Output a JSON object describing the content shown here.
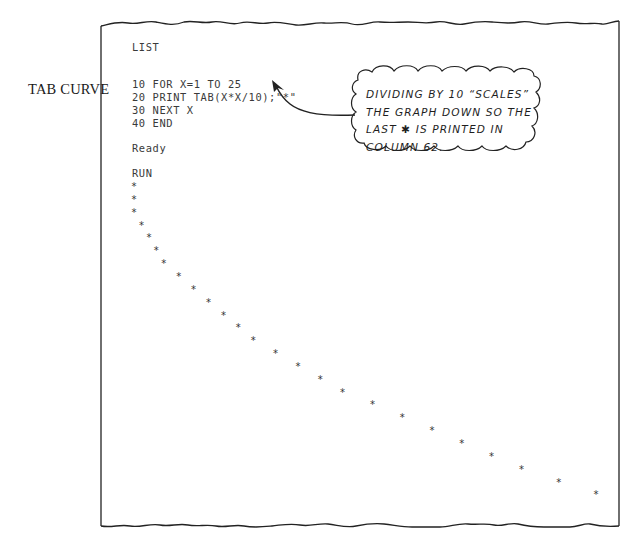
{
  "side_label": "TAB CURVE",
  "listing": {
    "command": "LIST",
    "lines": [
      "10 FOR X=1 TO 25",
      "20 PRINT TAB(X*X/10);\"*\"",
      "30 NEXT X",
      "40 END"
    ],
    "status": "Ready",
    "run_command": "RUN"
  },
  "callout": {
    "lines": [
      "DIVIDING BY 10 “SCALES”",
      "THE GRAPH DOWN SO THE",
      "LAST ✱ IS PRINTED IN",
      "COLUMN 62."
    ]
  },
  "output": {
    "symbol": "*",
    "count": 25
  },
  "chart_data": {
    "type": "scatter",
    "title": "TAB CURVE",
    "xlabel": "X (line of output)",
    "ylabel": "TAB column = INT(X*X/10)",
    "x": [
      1,
      2,
      3,
      4,
      5,
      6,
      7,
      8,
      9,
      10,
      11,
      12,
      13,
      14,
      15,
      16,
      17,
      18,
      19,
      20,
      21,
      22,
      23,
      24,
      25
    ],
    "values": [
      0,
      0,
      0,
      1,
      2,
      3,
      4,
      6,
      8,
      10,
      12,
      14,
      16,
      19,
      22,
      25,
      28,
      32,
      36,
      40,
      44,
      48,
      52,
      57,
      62
    ],
    "annotations": [
      "DIVIDING BY 10 “SCALES” THE GRAPH DOWN SO THE LAST * IS PRINTED IN COLUMN 62."
    ],
    "grid": false
  }
}
